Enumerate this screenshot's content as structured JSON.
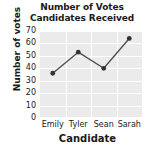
{
  "chart_data": {
    "type": "line",
    "title": "Number of Votes Candidates Received",
    "title_lines": [
      "Number of Votes",
      "Candidates Received"
    ],
    "xlabel": "Candidate",
    "ylabel": "Number of votes",
    "categories": [
      "Emily",
      "Tyler",
      "Sean",
      "Sarah"
    ],
    "values": [
      36,
      53,
      40,
      64
    ],
    "series": [
      {
        "name": "Number of votes",
        "values": [
          36,
          53,
          40,
          64
        ]
      }
    ],
    "ylim": [
      0,
      70
    ],
    "yticks": [
      0,
      10,
      20,
      30,
      40,
      50,
      60,
      70
    ],
    "ytick_labels": [
      "0",
      "10",
      "20",
      "30",
      "40",
      "50",
      "60",
      "70"
    ],
    "xtick_labels": [
      "Emily",
      "Tyler",
      "Sean",
      "Sarah"
    ],
    "grid": true,
    "grid_orientation": "both",
    "legend": false,
    "legend_position": "none",
    "marker": "circle",
    "colors": {
      "line": "#4d4d4d",
      "marker": "#333333",
      "plot_background": "#ebebeb",
      "grid": "#ffffff",
      "text": "#1a1a1a",
      "figure_background": "#ffffff"
    }
  }
}
